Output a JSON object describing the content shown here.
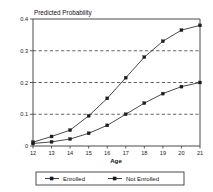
{
  "chart_data": {
    "type": "line",
    "title": "Predicted Probability",
    "xlabel": "Age",
    "ylabel": "",
    "x": [
      12,
      13,
      14,
      15,
      16,
      17,
      18,
      19,
      20,
      21
    ],
    "xticklabels": [
      "12",
      "13",
      "14",
      "15",
      "16",
      "17",
      "18",
      "19",
      "20",
      "21"
    ],
    "yticklabels": [
      "0",
      "0.1",
      "0.2",
      "0.3",
      "0.4"
    ],
    "ytickvalues": [
      0,
      0.1,
      0.2,
      0.3,
      0.4
    ],
    "xlim": [
      12,
      21
    ],
    "ylim": [
      0,
      0.4
    ],
    "grid": "horizontal-dashed",
    "gridlines": [
      0.1,
      0.2,
      0.3
    ],
    "legend_position": "below-center",
    "marker": "square",
    "series": [
      {
        "name": "Enrolled",
        "values": [
          0.008,
          0.013,
          0.022,
          0.04,
          0.065,
          0.1,
          0.135,
          0.165,
          0.187,
          0.2
        ]
      },
      {
        "name": "Not Enrolled",
        "values": [
          0.012,
          0.03,
          0.05,
          0.095,
          0.15,
          0.215,
          0.28,
          0.33,
          0.365,
          0.38
        ]
      }
    ]
  },
  "legend": {
    "items": [
      {
        "label": "Enrolled"
      },
      {
        "label": "Not Enrolled"
      }
    ]
  },
  "colors": {
    "line": "#2b2b2b",
    "axis": "#4a4a4a",
    "grid": "#3c3c3c",
    "background": "#ffffff"
  }
}
